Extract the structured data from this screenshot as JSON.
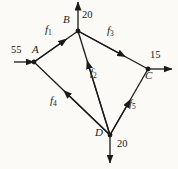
{
  "figure": {
    "type": "flow-network-diagram",
    "background_color": "#fbfaf6",
    "stroke_color": "#1a1a1a",
    "nodes": [
      {
        "id": "A",
        "label": "A",
        "x": 34,
        "y": 62,
        "label_x": 32,
        "label_y": 48
      },
      {
        "id": "B",
        "label": "B",
        "x": 78,
        "y": 31,
        "label_x": 63,
        "label_y": 18
      },
      {
        "id": "C",
        "label": "C",
        "x": 148,
        "y": 69,
        "label_x": 146,
        "label_y": 73
      },
      {
        "id": "D",
        "label": "D",
        "x": 110,
        "y": 135,
        "label_x": 96,
        "label_y": 133
      }
    ],
    "edges": [
      {
        "id": "f1",
        "label": "f",
        "subscript": "1",
        "from": "A",
        "to": "B",
        "label_x": 48,
        "label_y": 29
      },
      {
        "id": "f2",
        "label": "f",
        "subscript": "2",
        "from": "D",
        "to": "B",
        "label_x": 92,
        "label_y": 73
      },
      {
        "id": "f3",
        "label": "f",
        "subscript": "3",
        "from": "B",
        "to": "C",
        "label_x": 110,
        "label_y": 30
      },
      {
        "id": "f4",
        "label": "f",
        "subscript": "4",
        "from": "D",
        "to": "A",
        "label_x": 53,
        "label_y": 100
      },
      {
        "id": "f5",
        "label": "f",
        "subscript": "5",
        "from": "D",
        "to": "C",
        "label_x": 131,
        "label_y": 104
      }
    ],
    "external_flows": [
      {
        "id": "inflow-A",
        "value": "55",
        "node": "A",
        "direction": "in-from-left",
        "label_x": 12,
        "label_y": 49
      },
      {
        "id": "outflow-B",
        "value": "20",
        "node": "B",
        "direction": "out-up",
        "label_x": 82,
        "label_y": 13
      },
      {
        "id": "outflow-C",
        "value": "15",
        "node": "C",
        "direction": "out-right",
        "label_x": 151,
        "label_y": 54
      },
      {
        "id": "outflow-D",
        "value": "20",
        "node": "D",
        "direction": "out-down",
        "label_x": 118,
        "label_y": 143
      }
    ]
  }
}
